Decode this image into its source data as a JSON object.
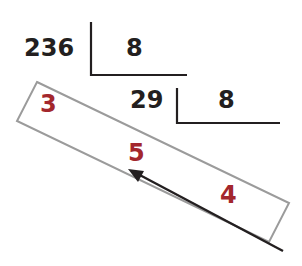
{
  "diagram": {
    "colors": {
      "text": "#231f20",
      "highlight": "#a3272d",
      "box_stroke": "#9b9b9b",
      "bracket": "#231f20",
      "arrow": "#231f20"
    },
    "step1": {
      "dividend": "236",
      "divisor": "8"
    },
    "step2": {
      "dividend": "29",
      "divisor": "8"
    },
    "highlighted_digits": {
      "first": "3",
      "second": "5",
      "third": "4"
    },
    "arrow": {
      "direction": "read from bottom-right to top-left"
    }
  }
}
